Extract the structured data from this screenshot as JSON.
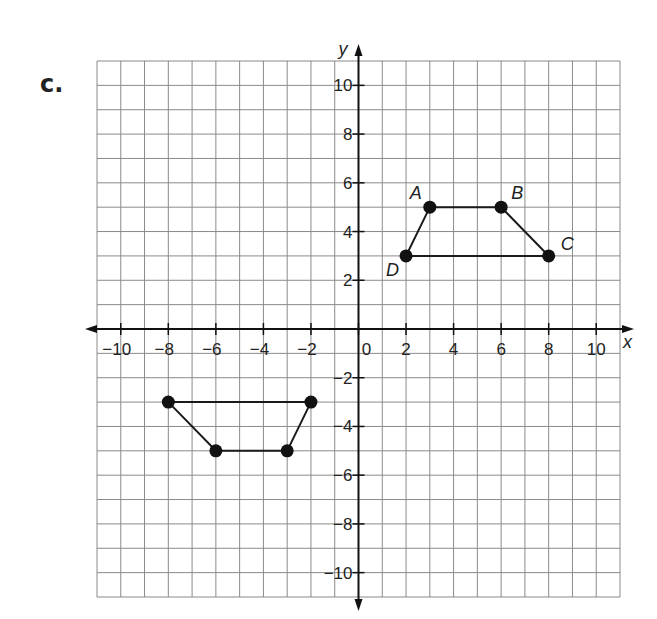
{
  "problem_label": "c.",
  "chart_data": {
    "type": "scatter",
    "title": "",
    "xlabel": "x",
    "ylabel": "y",
    "xlim": [
      -11,
      11
    ],
    "ylim": [
      -11,
      11
    ],
    "grid": true,
    "x_ticks": [
      -10,
      -8,
      -6,
      -4,
      -2,
      0,
      2,
      4,
      6,
      8,
      10
    ],
    "y_ticks": [
      -10,
      -8,
      -6,
      -4,
      -2,
      2,
      4,
      6,
      8,
      10
    ],
    "x_tick_labels": [
      "−10",
      "−8",
      "−6",
      "−4",
      "−2",
      "0",
      "2",
      "4",
      "6",
      "8",
      "10"
    ],
    "y_tick_labels": [
      "−10",
      "−8",
      "−6",
      "−4",
      "−2",
      "2",
      "4",
      "6",
      "8",
      "10"
    ],
    "series": [
      {
        "name": "ABCD",
        "closed": true,
        "points": [
          {
            "label": "A",
            "x": 3,
            "y": 5
          },
          {
            "label": "B",
            "x": 6,
            "y": 5
          },
          {
            "label": "C",
            "x": 8,
            "y": 3
          },
          {
            "label": "D",
            "x": 2,
            "y": 3
          }
        ]
      },
      {
        "name": "image",
        "closed": true,
        "points": [
          {
            "label": "",
            "x": -3,
            "y": -5
          },
          {
            "label": "",
            "x": -6,
            "y": -5
          },
          {
            "label": "",
            "x": -8,
            "y": -3
          },
          {
            "label": "",
            "x": -2,
            "y": -3
          }
        ]
      }
    ]
  }
}
